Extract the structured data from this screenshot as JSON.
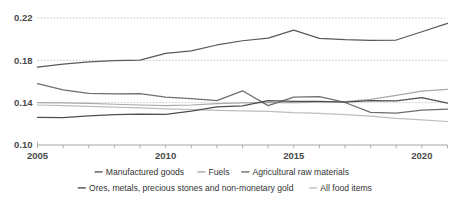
{
  "chart_data": {
    "type": "line",
    "title": "",
    "subtitle": "",
    "xlabel": "",
    "ylabel": "",
    "xlim": [
      2005,
      2021
    ],
    "ylim": [
      0.1,
      0.22
    ],
    "grid": true,
    "grid_axis": "y",
    "legend_position": "bottom",
    "x": [
      2005,
      2006,
      2007,
      2008,
      2009,
      2010,
      2011,
      2012,
      2013,
      2014,
      2015,
      2016,
      2017,
      2018,
      2019,
      2020,
      2021
    ],
    "y_ticks": [
      "0.10",
      "0.14",
      "0.18",
      "0.22"
    ],
    "y_tick_values": [
      0.1,
      0.14,
      0.18,
      0.22
    ],
    "x_ticks": [
      "2005",
      "2010",
      "2015",
      "2020"
    ],
    "x_tick_values": [
      2005,
      2010,
      2015,
      2020
    ],
    "series": [
      {
        "name": "Manufactured goods",
        "color": "#58595b",
        "values": [
          0.1735,
          0.1765,
          0.1785,
          0.1798,
          0.1802,
          0.1865,
          0.189,
          0.1945,
          0.1985,
          0.201,
          0.2085,
          0.2008,
          0.1995,
          0.1988,
          0.1992,
          0.207,
          0.215
        ]
      },
      {
        "name": "Fuels",
        "color": "#a7a9ac",
        "values": [
          0.14,
          0.1398,
          0.1393,
          0.1385,
          0.1378,
          0.1372,
          0.1378,
          0.139,
          0.1398,
          0.1402,
          0.14,
          0.1405,
          0.141,
          0.1432,
          0.147,
          0.151,
          0.1525
        ]
      },
      {
        "name": "Agricultural raw materials",
        "color": "#6d6e71",
        "values": [
          0.158,
          0.152,
          0.1488,
          0.1482,
          0.1485,
          0.1452,
          0.1438,
          0.142,
          0.1512,
          0.1372,
          0.1452,
          0.1458,
          0.1402,
          0.1308,
          0.1302,
          0.133,
          0.1338
        ]
      },
      {
        "name": "Ores, metals, precious stones and non-monetary gold",
        "color": "#4d4e52",
        "values": [
          0.1262,
          0.1258,
          0.1275,
          0.1288,
          0.1292,
          0.129,
          0.132,
          0.136,
          0.137,
          0.142,
          0.1412,
          0.1412,
          0.1405,
          0.142,
          0.1418,
          0.1448,
          0.1395
        ]
      },
      {
        "name": "All food items",
        "color": "#bcbec0",
        "values": [
          0.1378,
          0.1372,
          0.1365,
          0.1358,
          0.135,
          0.1342,
          0.1335,
          0.1328,
          0.1322,
          0.1318,
          0.1305,
          0.1298,
          0.1288,
          0.1272,
          0.1252,
          0.1238,
          0.1222
        ]
      }
    ]
  },
  "legend": {
    "row1": [
      {
        "label": "Manufactured goods",
        "color": "#58595b"
      },
      {
        "label": "Fuels",
        "color": "#a7a9ac"
      },
      {
        "label": "Agricultural raw materials",
        "color": "#6d6e71"
      }
    ],
    "row2": [
      {
        "label": "Ores, metals, precious stones and non-monetary gold",
        "color": "#4d4e52"
      },
      {
        "label": "All food items",
        "color": "#bcbec0"
      }
    ]
  }
}
